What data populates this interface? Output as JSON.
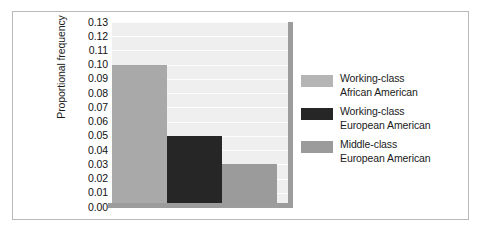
{
  "chart_data": {
    "type": "bar",
    "title": "",
    "xlabel": "",
    "ylabel": "Proportional frequency",
    "ylim": [
      0.0,
      0.13
    ],
    "grid": true,
    "legend_position": "right",
    "categories": [
      "Working-class African American",
      "Working-class European American",
      "Middle-class European American"
    ],
    "values": [
      0.1,
      0.05,
      0.03
    ],
    "ytick_labels": [
      "0.13",
      "0.12",
      "0.11",
      "0.10",
      "0.09",
      "0.08",
      "0.07",
      "0.06",
      "0.05",
      "0.04",
      "0.03",
      "0.02",
      "0.01",
      "0.00"
    ],
    "ytick_values": [
      0.13,
      0.12,
      0.11,
      0.1,
      0.09,
      0.08,
      0.07,
      0.06,
      0.05,
      0.04,
      0.03,
      0.02,
      0.01,
      0.0
    ],
    "series_colors": [
      "#a9a9a9",
      "#262626",
      "#9b9b9b"
    ]
  },
  "legend": {
    "items": [
      {
        "line1": "Working-class",
        "line2": "African American",
        "color": "#b5b5b5",
        "value": 0.1
      },
      {
        "line1": "Working-class",
        "line2": "European American",
        "color": "#262626",
        "value": 0.05
      },
      {
        "line1": "Middle-class",
        "line2": "European American",
        "color": "#9b9b9b",
        "value": 0.03
      }
    ]
  },
  "axis": {
    "y_title": "Proportional frequency"
  },
  "style": {
    "plot_background": "#efefef",
    "gridline_color": "#fdfdfd",
    "axis_color": "#9c9c9c",
    "frame_color": "#b9b9b9",
    "text_color": "#1b1b1b"
  }
}
